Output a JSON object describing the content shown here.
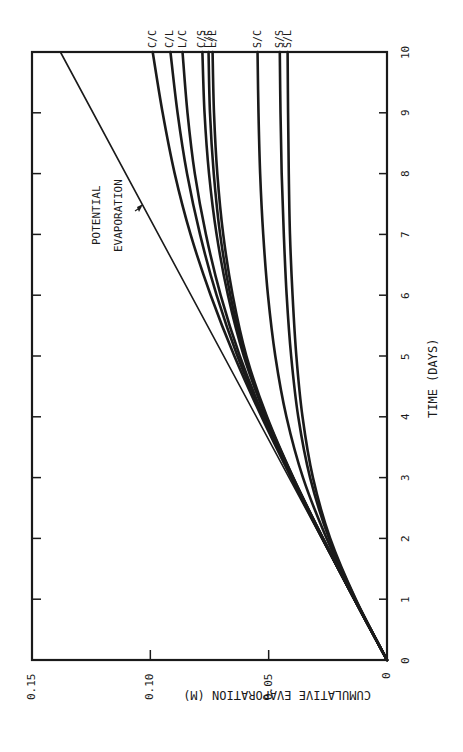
{
  "chart_data": {
    "type": "line",
    "orientation": "rotated 90deg counter-clockwise (time axis vertical on right, evaporation axis horizontal at bottom, reversed)",
    "title": "",
    "xlabel": "TIME (DAYS)",
    "ylabel": "CUMULATIVE EVAPORATION (M)",
    "xlim": [
      0,
      10
    ],
    "ylim": [
      0,
      0.15
    ],
    "x_ticks": [
      "0",
      "1",
      "2",
      "3",
      "4",
      "5",
      "6",
      "7",
      "8",
      "9",
      "10"
    ],
    "y_ticks": [
      "0",
      "0.05",
      "0.10",
      "0.15"
    ],
    "grid": false,
    "x": [
      0,
      1,
      2,
      3,
      4,
      5,
      6,
      7,
      8,
      9,
      10
    ],
    "series": [
      {
        "name": "POTENTIAL EVAPORATION",
        "values": [
          0,
          0.0138,
          0.0276,
          0.0414,
          0.0552,
          0.069,
          0.0828,
          0.0966,
          0.1104,
          0.1242,
          0.138
        ]
      },
      {
        "name": "C/C",
        "values": [
          0,
          0.0138,
          0.0274,
          0.0405,
          0.053,
          0.0645,
          0.0745,
          0.083,
          0.0897,
          0.0948,
          0.099
        ]
      },
      {
        "name": "C/L",
        "values": [
          0,
          0.0138,
          0.0273,
          0.0403,
          0.0525,
          0.0632,
          0.072,
          0.079,
          0.0845,
          0.0885,
          0.0915
        ]
      },
      {
        "name": "L/C",
        "values": [
          0,
          0.0138,
          0.0272,
          0.04,
          0.052,
          0.0622,
          0.0703,
          0.0765,
          0.0812,
          0.0843,
          0.0864
        ]
      },
      {
        "name": "C/S",
        "values": [
          0,
          0.0138,
          0.0271,
          0.0398,
          0.0512,
          0.0605,
          0.0672,
          0.072,
          0.0752,
          0.0771,
          0.078
        ]
      },
      {
        "name": "L/S",
        "values": [
          0,
          0.0138,
          0.0271,
          0.0397,
          0.051,
          0.06,
          0.0662,
          0.0705,
          0.0732,
          0.0748,
          0.0754
        ]
      },
      {
        "name": "L/L",
        "values": [
          0,
          0.0138,
          0.027,
          0.0396,
          0.0507,
          0.0594,
          0.0652,
          0.0692,
          0.0717,
          0.0731,
          0.0737
        ]
      },
      {
        "name": "S/C",
        "values": [
          0,
          0.0135,
          0.0255,
          0.0355,
          0.0425,
          0.0472,
          0.0503,
          0.0523,
          0.0536,
          0.0543,
          0.0547
        ]
      },
      {
        "name": "S/S",
        "values": [
          0,
          0.0133,
          0.0245,
          0.0325,
          0.0375,
          0.0405,
          0.0424,
          0.0436,
          0.0445,
          0.045,
          0.0453
        ]
      },
      {
        "name": "S/L",
        "values": [
          0,
          0.0132,
          0.024,
          0.0313,
          0.0357,
          0.0383,
          0.0399,
          0.041,
          0.0415,
          0.0418,
          0.042
        ]
      }
    ],
    "annotations": [
      {
        "text": "POTENTIAL",
        "line": 1
      },
      {
        "text": "EVAPORATION",
        "line": 2,
        "arrow_to": "potential evaporation line"
      }
    ],
    "legend": "inline curve end labels at t=10 (top edge)"
  },
  "labels": {
    "xlabel": "TIME (DAYS)",
    "ylabel": "CUMULATIVE EVAPORATION (M)",
    "annot1": "POTENTIAL",
    "annot2": "EVAPORATION"
  },
  "colors": {
    "line": "#1a1a1a",
    "background": "#ffffff"
  }
}
